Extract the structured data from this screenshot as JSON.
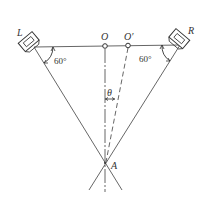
{
  "diagram": {
    "type": "triangulation-geometry",
    "labels": {
      "left_device": "L",
      "right_device": "R",
      "point_o": "O",
      "point_o_prime": "O′",
      "point_a": "A",
      "theta": "θ",
      "left_angle": "60°",
      "right_angle": "60°"
    },
    "colors": {
      "stroke": "#555555",
      "text": "#333333",
      "background": "#ffffff"
    }
  }
}
